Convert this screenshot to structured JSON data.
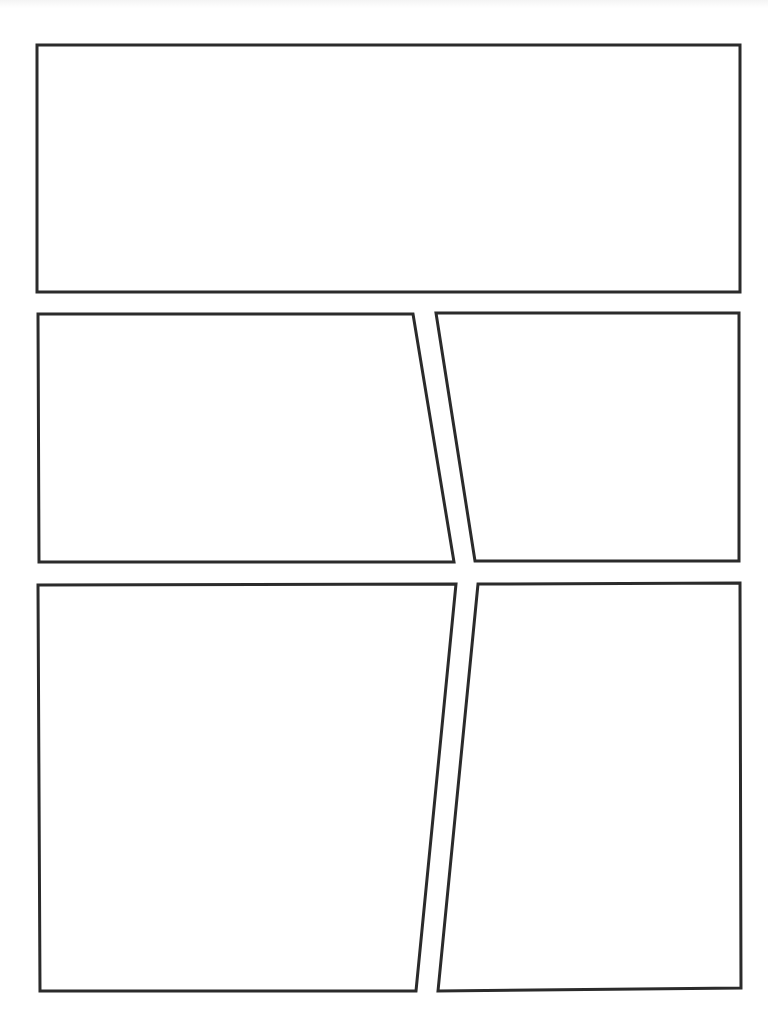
{
  "page": {
    "type": "comic-page-template",
    "background_color": "#ffffff",
    "border_color": "#2b2b2b",
    "panel_count": 5
  },
  "panels": [
    {
      "id": "panel-1",
      "points": "37,45 740,45 740,292 37,292"
    },
    {
      "id": "panel-2",
      "points": "38,314 413,314 454,562 39,562"
    },
    {
      "id": "panel-3",
      "points": "436,313 739,313 739,561 475,561"
    },
    {
      "id": "panel-4",
      "points": "38,585 456,584 416,991 40,991"
    },
    {
      "id": "panel-5",
      "points": "478,584 740,583 741,988 438,991"
    }
  ]
}
